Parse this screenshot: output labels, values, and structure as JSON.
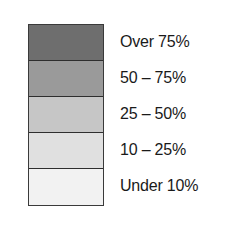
{
  "legend": {
    "items": [
      {
        "label": "Over 75%",
        "color": "#6e6e6e"
      },
      {
        "label": "50 – 75%",
        "color": "#9a9a9a"
      },
      {
        "label": "25 – 50%",
        "color": "#c6c6c6"
      },
      {
        "label": "10 – 25%",
        "color": "#e0e0e0"
      },
      {
        "label": "Under 10%",
        "color": "#f2f2f2"
      }
    ]
  }
}
